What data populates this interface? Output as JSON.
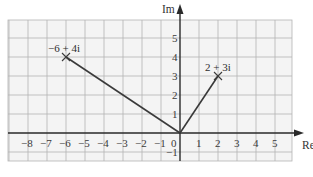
{
  "diagram": {
    "type": "argand-diagram",
    "axes": {
      "x_label": "Re",
      "y_label": "Im",
      "x_range": [
        -9,
        6
      ],
      "y_range": [
        -1.5,
        6
      ],
      "x_ticks": [
        "-8",
        "-7",
        "-6",
        "-5",
        "-4",
        "-3",
        "-2",
        "-1",
        "0",
        "1",
        "2",
        "3",
        "4",
        "5"
      ],
      "y_ticks": [
        "-1",
        "1",
        "2",
        "3",
        "4",
        "5"
      ],
      "origin_label": "0"
    },
    "points": [
      {
        "label": "-6 + 4i",
        "re": -6,
        "im": 4
      },
      {
        "label": "2 + 3i",
        "re": 2,
        "im": 3
      }
    ],
    "vectors": [
      {
        "from": "0",
        "to": "-6 + 4i"
      },
      {
        "from": "0",
        "to": "2 + 3i"
      }
    ],
    "colors": {
      "background": "#ffffff",
      "grid_fill": "#f4f4f4",
      "grid_line": "#b4b4b4",
      "axis": "#2a2a2a",
      "vector": "#3a3a3a"
    }
  },
  "labels": {
    "re": "Re",
    "im": "Im",
    "point_a": "−6 + 4i",
    "point_b": "2 + 3i",
    "x_neg8": "−8",
    "x_neg7": "−7",
    "x_neg6": "−6",
    "x_neg5": "−5",
    "x_neg4": "−4",
    "x_neg3": "−3",
    "x_neg2": "−2",
    "x_neg1": "−1",
    "x_0": "0",
    "x_1": "1",
    "x_2": "2",
    "x_3": "3",
    "x_4": "4",
    "x_5": "5",
    "y_1": "1",
    "y_2": "2",
    "y_3": "3",
    "y_4": "4",
    "y_5": "5",
    "y_neg1": "−1"
  }
}
